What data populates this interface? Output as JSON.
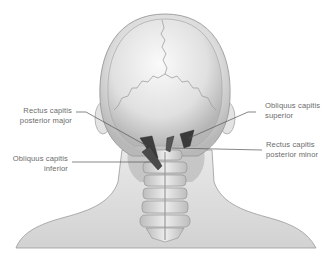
{
  "diagram": {
    "labels": [
      {
        "id": "rcpmaj",
        "line1": "Rectus capitis",
        "line2": "posterior major",
        "side": "left"
      },
      {
        "id": "oci",
        "line1": "Obliquus capitis",
        "line2": "inferior",
        "side": "left"
      },
      {
        "id": "ocs",
        "line1": "Obliquus capitis",
        "line2": "superior",
        "side": "right"
      },
      {
        "id": "rcpmin",
        "line1": "Rectus capitis",
        "line2": "posterior minor",
        "side": "right"
      }
    ],
    "colors": {
      "background": "#ffffff",
      "skin_light": "#ececec",
      "skin_shade": "#bdbdbd",
      "skull": "#e2e2e2",
      "bone": "#d6d6d6",
      "muscle": "#3a3a3a",
      "leader_line": "#555555",
      "label_text": "#6b6b6b"
    }
  }
}
